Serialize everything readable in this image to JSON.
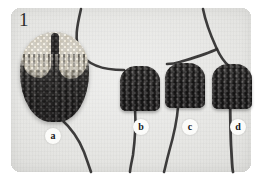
{
  "figure": {
    "number": "1",
    "caption_labels": [
      "a",
      "b",
      "c",
      "d"
    ]
  },
  "photo": {
    "description": "knitted-swatches-photograph",
    "background_color": "#e2e2df",
    "yarn_color": "#2e2c2c"
  },
  "pieces": [
    {
      "id": "a",
      "label": "a",
      "name": "large-oval-knitted-swatch",
      "colors": {
        "crown": "#ece7da",
        "body": "#383635"
      }
    },
    {
      "id": "b",
      "label": "b",
      "name": "small-knitted-swatch",
      "colors": {
        "body": "#363433"
      }
    },
    {
      "id": "c",
      "label": "c",
      "name": "small-knitted-swatch",
      "colors": {
        "body": "#363433"
      }
    },
    {
      "id": "d",
      "label": "d",
      "name": "small-knitted-swatch",
      "colors": {
        "body": "#363433"
      }
    }
  ]
}
